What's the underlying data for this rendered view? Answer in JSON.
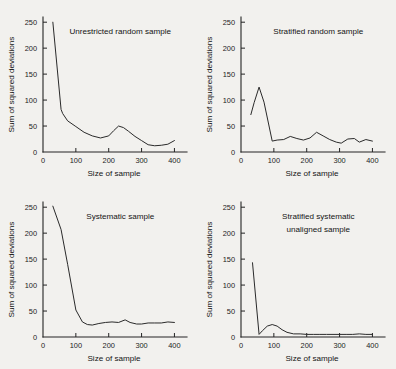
{
  "figure": {
    "background_color": "#f2f1ee",
    "ink_color": "#242424",
    "panel_count": 4
  },
  "chart_data": [
    {
      "type": "line",
      "title": "Unrestricted random sample",
      "title_lines": [
        "Unrestricted random sample"
      ],
      "xlabel": "Size of  sample",
      "ylabel": "Sum of squared deviations",
      "xlim": [
        0,
        420
      ],
      "ylim": [
        0,
        260
      ],
      "xticks": [
        0,
        100,
        200,
        300,
        400
      ],
      "xtick_labels": [
        "0",
        "100",
        "200",
        "300",
        "400"
      ],
      "yticks": [
        0,
        50,
        100,
        150,
        200,
        250
      ],
      "ytick_labels": [
        "0",
        "50",
        "100",
        "150",
        "200",
        "250"
      ],
      "grid": false,
      "legend": "none",
      "x": [
        30,
        55,
        60,
        75,
        100,
        125,
        150,
        175,
        200,
        215,
        230,
        245,
        260,
        280,
        300,
        320,
        340,
        360,
        380,
        400
      ],
      "y": [
        250,
        82,
        74,
        60,
        49,
        38,
        31,
        27,
        31,
        41,
        50,
        47,
        40,
        30,
        22,
        14,
        12,
        13,
        15,
        22
      ]
    },
    {
      "type": "line",
      "title": "Stratified random sample",
      "title_lines": [
        "Stratified random sample"
      ],
      "xlabel": "Size of  sample",
      "ylabel": "Sum of squared deviations",
      "xlim": [
        0,
        420
      ],
      "ylim": [
        0,
        260
      ],
      "xticks": [
        0,
        100,
        200,
        300,
        400
      ],
      "xtick_labels": [
        "0",
        "100",
        "200",
        "300",
        "400"
      ],
      "yticks": [
        0,
        50,
        100,
        150,
        200,
        250
      ],
      "ytick_labels": [
        "0",
        "50",
        "100",
        "150",
        "200",
        "250"
      ],
      "grid": false,
      "legend": "none",
      "x": [
        30,
        40,
        55,
        70,
        95,
        110,
        130,
        150,
        170,
        190,
        210,
        230,
        250,
        270,
        290,
        305,
        325,
        345,
        360,
        380,
        400
      ],
      "y": [
        72,
        95,
        125,
        96,
        21,
        23,
        24,
        30,
        26,
        23,
        27,
        38,
        31,
        24,
        19,
        17,
        25,
        26,
        19,
        24,
        21
      ]
    },
    {
      "type": "line",
      "title": "Systematic sample",
      "title_lines": [
        "Systematic sample"
      ],
      "xlabel": "Size of  sample",
      "ylabel": "Sum of squared deviations",
      "xlim": [
        0,
        420
      ],
      "ylim": [
        0,
        260
      ],
      "xticks": [
        0,
        100,
        200,
        300,
        400
      ],
      "xtick_labels": [
        "0",
        "100",
        "200",
        "300",
        "400"
      ],
      "yticks": [
        0,
        50,
        100,
        150,
        200,
        250
      ],
      "ytick_labels": [
        "0",
        "50",
        "100",
        "150",
        "200",
        "250"
      ],
      "grid": false,
      "legend": "none",
      "x": [
        30,
        55,
        75,
        100,
        120,
        135,
        150,
        170,
        190,
        210,
        230,
        250,
        265,
        285,
        300,
        320,
        340,
        360,
        380,
        400
      ],
      "y": [
        252,
        207,
        140,
        52,
        29,
        24,
        23,
        26,
        28,
        29,
        28,
        33,
        28,
        25,
        25,
        27,
        27,
        27,
        29,
        28
      ]
    },
    {
      "type": "line",
      "title": "Stratified systematic unaligned sample",
      "title_lines": [
        "Stratified systematic",
        "unaligned sample"
      ],
      "xlabel": "Size of  sample",
      "ylabel": "Sum of squared deviations",
      "xlim": [
        0,
        420
      ],
      "ylim": [
        0,
        260
      ],
      "xticks": [
        0,
        100,
        200,
        300,
        400
      ],
      "xtick_labels": [
        "0",
        "100",
        "200",
        "300",
        "400"
      ],
      "yticks": [
        0,
        50,
        100,
        150,
        200,
        250
      ],
      "ytick_labels": [
        "0",
        "50",
        "100",
        "150",
        "200",
        "250"
      ],
      "grid": false,
      "legend": "none",
      "x": [
        35,
        55,
        65,
        80,
        95,
        110,
        125,
        140,
        160,
        180,
        200,
        220,
        240,
        260,
        280,
        300,
        320,
        340,
        360,
        380,
        400
      ],
      "y": [
        143,
        5,
        12,
        21,
        24,
        21,
        14,
        9,
        6,
        6,
        5,
        5,
        5,
        5,
        5,
        5,
        5,
        5,
        6,
        5,
        5
      ]
    }
  ]
}
